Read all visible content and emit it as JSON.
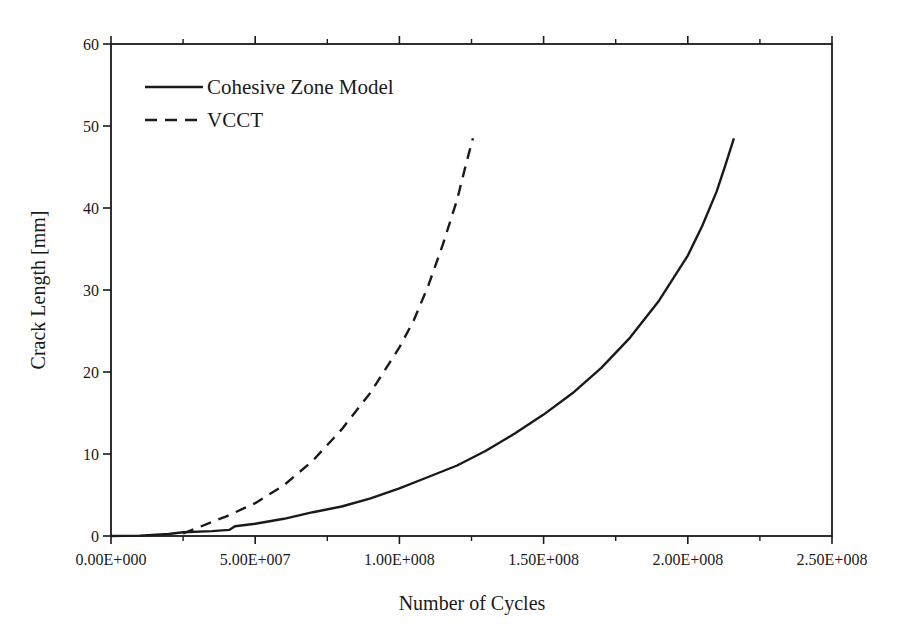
{
  "chart_data": {
    "type": "line",
    "title": "",
    "xlabel": "Number of Cycles",
    "ylabel": "Crack Length [mm]",
    "xlim": [
      0,
      250000000
    ],
    "ylim": [
      0,
      60
    ],
    "grid": false,
    "legend_position": "upper-left",
    "x_ticks": [
      0,
      50000000,
      100000000,
      150000000,
      200000000,
      250000000
    ],
    "x_tick_labels": [
      "0.00E+000",
      "5.00E+007",
      "1.00E+008",
      "1.50E+008",
      "2.00E+008",
      "2.50E+008"
    ],
    "x_minor_ticks": [
      25000000,
      75000000,
      125000000,
      175000000,
      225000000
    ],
    "y_ticks": [
      0,
      10,
      20,
      30,
      40,
      50,
      60
    ],
    "y_tick_labels": [
      "0",
      "10",
      "20",
      "30",
      "40",
      "50",
      "60"
    ],
    "series": [
      {
        "name": "Cohesive Zone Model",
        "line_style": "solid",
        "color": "#1a1a1a",
        "x": [
          0,
          10000000,
          20000000,
          25000000,
          35000000,
          41000000,
          43000000,
          50000000,
          60000000,
          70000000,
          80000000,
          90000000,
          100000000,
          110000000,
          120000000,
          130000000,
          140000000,
          150000000,
          160000000,
          170000000,
          180000000,
          190000000,
          200000000,
          205000000,
          210000000,
          213000000,
          216000000
        ],
        "y": [
          0,
          0.05,
          0.25,
          0.45,
          0.6,
          0.75,
          1.2,
          1.5,
          2.1,
          2.9,
          3.6,
          4.6,
          5.8,
          7.2,
          8.6,
          10.4,
          12.5,
          14.8,
          17.4,
          20.5,
          24.2,
          28.7,
          34.2,
          37.8,
          42.0,
          45.2,
          48.5
        ]
      },
      {
        "name": "VCCT",
        "line_style": "dashed",
        "color": "#1a1a1a",
        "x": [
          25000000,
          30000000,
          40000000,
          50000000,
          60000000,
          70000000,
          80000000,
          90000000,
          100000000,
          105000000,
          110000000,
          115000000,
          120000000,
          123000000,
          125500000
        ],
        "y": [
          0.3,
          1.0,
          2.4,
          4.0,
          6.2,
          9.2,
          13.0,
          17.5,
          23.0,
          26.3,
          30.5,
          35.5,
          41.0,
          45.2,
          48.5
        ]
      }
    ]
  },
  "legend": {
    "items": [
      {
        "label": "Cohesive Zone Model",
        "style": "solid"
      },
      {
        "label": "VCCT",
        "style": "dashed"
      }
    ]
  },
  "colors": {
    "ink": "#1a1a1a",
    "background": "#ffffff"
  }
}
